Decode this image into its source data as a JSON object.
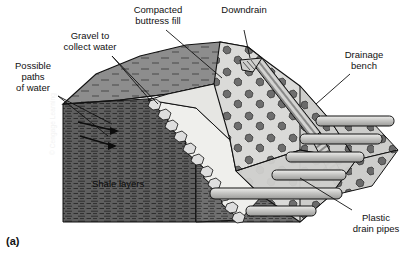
{
  "figure": {
    "panel_label": "(a)",
    "credit": "© Cengage Learning"
  },
  "labels": {
    "compacted_buttress_fill": "Compacted\nbuttress fill",
    "downdrain": "Downdrain",
    "drainage_bench": "Drainage\nbench",
    "gravel_to_collect_water": "Gravel to\ncollect water",
    "possible_paths_of_water": "Possible\npaths\nof water",
    "plastic_drain_pipes": "Plastic\ndrain pipes",
    "shale_layers": "Shale layers"
  },
  "colors": {
    "shale": "#6f6f6f",
    "shale_dark": "#3f3f3f",
    "top_surface": "#8a8a8a",
    "buttress_fill": "#d8d8d6",
    "buttress_fill_face": "#c9c9c7",
    "gravel_wedge": "#efefec",
    "cobble": "#6b6b6b",
    "pipe": "#c2c2c0",
    "outline": "#111111",
    "background": "#ffffff",
    "leader": "#111111"
  }
}
